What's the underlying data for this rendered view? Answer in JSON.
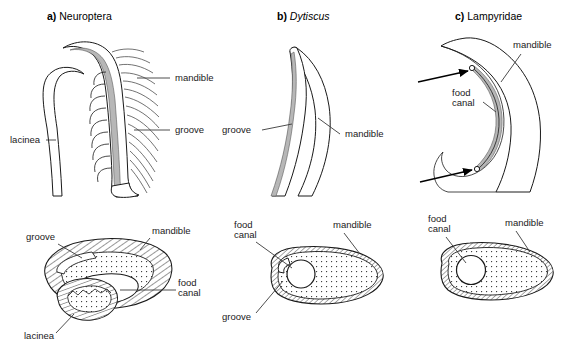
{
  "figure": {
    "type": "scientific-diagram",
    "background_color": "#ffffff",
    "ink_color": "#1a1a1a",
    "groove_fill_color": "#b7b7b7"
  },
  "panels": [
    {
      "id": "a",
      "letter": "a)",
      "name": "Neuroptera",
      "italic_name": false,
      "top_view": {
        "description": "Longitudinal view of mandible with lacinea, dense bristles and shaded groove",
        "labels": [
          {
            "text": "mandible",
            "anchor": "start",
            "x": 175,
            "y": 81
          },
          {
            "text": "groove",
            "anchor": "start",
            "x": 175,
            "y": 133
          },
          {
            "text": "lacinea",
            "anchor": "start",
            "x": 10,
            "y": 143
          }
        ]
      },
      "cross_section": {
        "description": "Cross-section showing hatched mandible, dotted core, food canal cavity and separate lacinea lobe",
        "labels": [
          {
            "text": "groove",
            "anchor": "start",
            "x": 26,
            "y": 240
          },
          {
            "text": "mandible",
            "anchor": "start",
            "x": 152,
            "y": 234
          },
          {
            "text": "food",
            "anchor": "start",
            "x": 178,
            "y": 286
          },
          {
            "text": "canal",
            "anchor": "start",
            "x": 178,
            "y": 296
          },
          {
            "text": "lacinea",
            "anchor": "start",
            "x": 24,
            "y": 339
          }
        ]
      }
    },
    {
      "id": "b",
      "letter": "b)",
      "name": "Dytiscus",
      "italic_name": true,
      "top_view": {
        "description": "Sickle-shaped mandible with narrow shaded groove along the concave inner margin",
        "labels": [
          {
            "text": "groove",
            "anchor": "start",
            "x": 222,
            "y": 133
          },
          {
            "text": "mandible",
            "anchor": "start",
            "x": 345,
            "y": 137
          }
        ]
      },
      "cross_section": {
        "description": "Oval cross-section with hatched rim, dotted interior, round food canal and groove slit",
        "labels": [
          {
            "text": "food",
            "anchor": "start",
            "x": 234,
            "y": 228
          },
          {
            "text": "canal",
            "anchor": "start",
            "x": 234,
            "y": 238
          },
          {
            "text": "mandible",
            "anchor": "start",
            "x": 333,
            "y": 228
          },
          {
            "text": "groove",
            "anchor": "start",
            "x": 222,
            "y": 320
          }
        ]
      }
    },
    {
      "id": "c",
      "letter": "c)",
      "name": "Lampyridae",
      "italic_name": false,
      "top_view": {
        "description": "Sickle mandible with enclosed food canal running from tip to base, indicated by two arrows",
        "labels": [
          {
            "text": "mandible",
            "anchor": "start",
            "x": 513,
            "y": 48
          },
          {
            "text": "food",
            "anchor": "start",
            "x": 452,
            "y": 96
          },
          {
            "text": "canal",
            "anchor": "start",
            "x": 452,
            "y": 106
          }
        ],
        "arrows": [
          {
            "name": "upper-food-canal-arrow",
            "x1": 418,
            "y1": 82,
            "x2": 472,
            "y2": 71
          },
          {
            "name": "lower-food-canal-arrow",
            "x1": 420,
            "y1": 182,
            "x2": 476,
            "y2": 167
          }
        ]
      },
      "cross_section": {
        "description": "Oval cross-section with hatched rim, dotted interior and enclosed circular food canal",
        "labels": [
          {
            "text": "food",
            "anchor": "start",
            "x": 428,
            "y": 222
          },
          {
            "text": "canal",
            "anchor": "start",
            "x": 428,
            "y": 232
          },
          {
            "text": "mandible",
            "anchor": "start",
            "x": 505,
            "y": 226
          }
        ]
      }
    }
  ],
  "structure_terms": [
    "mandible",
    "groove",
    "lacinea",
    "food canal"
  ]
}
